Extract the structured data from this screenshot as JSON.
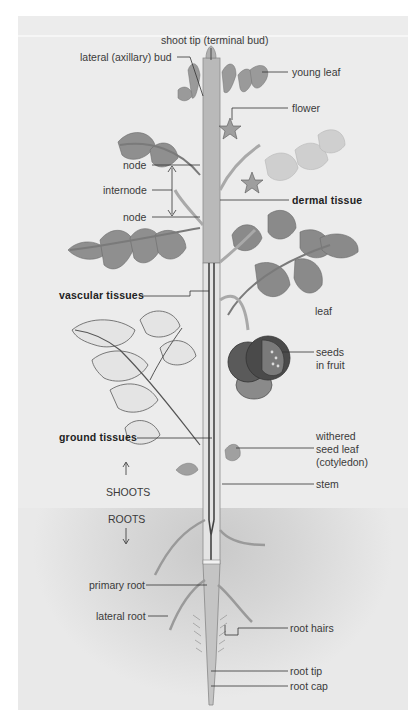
{
  "figure": {
    "colors": {
      "panel": "#ececec",
      "soil": "#cfcfcf",
      "stem": "#b8b8b8",
      "leaf": "#8a8a8a",
      "leaf_light": "#bdbdbd",
      "fruit": "#555555",
      "line": "#333333"
    }
  },
  "labels": {
    "shoot_tip": "shoot tip (terminal bud)",
    "lateral_bud": "lateral (axillary) bud",
    "young_leaf": "young leaf",
    "flower": "flower",
    "node_upper": "node",
    "internode": "internode",
    "node_lower": "node",
    "dermal_tissue": "dermal tissue",
    "vascular_tissues": "vascular tissues",
    "leaf": "leaf",
    "seeds_in_fruit_1": "seeds",
    "seeds_in_fruit_2": "in fruit",
    "ground_tissues": "ground tissues",
    "withered_1": "withered",
    "withered_2": "seed leaf",
    "withered_3": "(cotyledon)",
    "stem": "stem",
    "shoots": "SHOOTS",
    "roots": "ROOTS",
    "primary_root": "primary root",
    "lateral_root": "lateral root",
    "root_hairs": "root hairs",
    "root_tip": "root tip",
    "root_cap": "root cap"
  }
}
